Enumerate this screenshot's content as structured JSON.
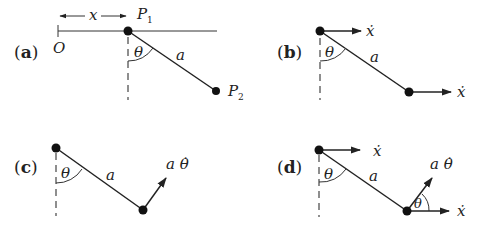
{
  "figure": {
    "panels": [
      {
        "id": "a",
        "label": "(a)",
        "texts": {
          "origin": "O",
          "x": "x",
          "p1": "P",
          "p1_sub": "1",
          "p2": "P",
          "p2_sub": "2",
          "theta": "θ",
          "length": "a"
        }
      },
      {
        "id": "b",
        "label": "(b)",
        "texts": {
          "theta": "θ",
          "length": "a",
          "v_top": "ẋ",
          "v_bottom": "ẋ"
        }
      },
      {
        "id": "c",
        "label": "(c)",
        "texts": {
          "theta": "θ",
          "length": "a",
          "v_bottom": "a θ̇"
        }
      },
      {
        "id": "d",
        "label": "(d)",
        "texts": {
          "theta": "θ",
          "length": "a",
          "v_top": "ẋ",
          "v_bottom_rot": "a θ̇",
          "theta_bottom": "θ",
          "v_bottom_x": "ẋ"
        }
      }
    ],
    "colors": {
      "ink": "#222222",
      "background": "#ffffff"
    }
  }
}
